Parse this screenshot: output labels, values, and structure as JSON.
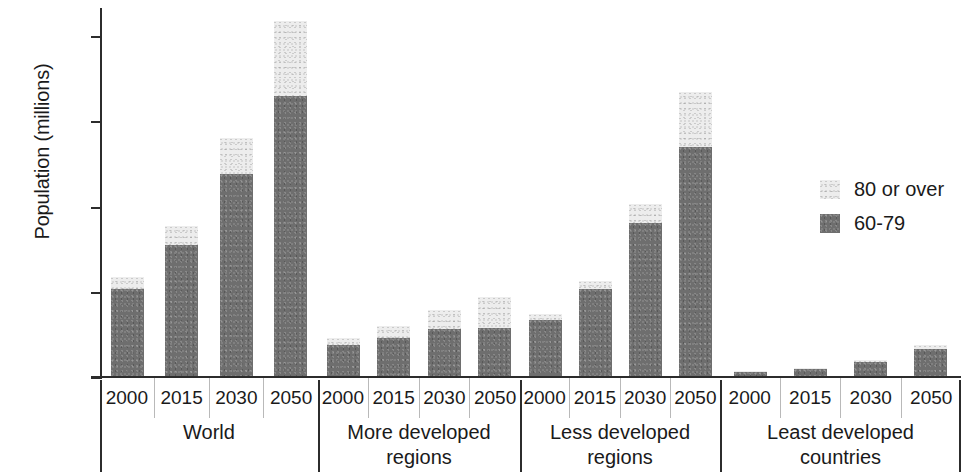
{
  "chart_data": {
    "type": "bar",
    "stacked": true,
    "title": "",
    "xlabel": "",
    "ylabel": "Population (millions)",
    "ylim": [
      0,
      2150
    ],
    "yticks": [
      0,
      500,
      1000,
      1500,
      2000
    ],
    "ytick_labels": [
      "0",
      "500",
      "1.000",
      "1.500",
      "2.000"
    ],
    "grid": false,
    "legend_position": "right",
    "legend": [
      "80 or over",
      "60-79"
    ],
    "colors": {
      "80 or over": "#ededed",
      "60-79": "#6e6e6e"
    },
    "categories": [
      "2000",
      "2015",
      "2030",
      "2050"
    ],
    "groups": [
      "World",
      "More developed regions",
      "Less developed regions",
      "Least developed countries"
    ],
    "series": [
      {
        "name": "60-79",
        "values": {
          "World": [
            510,
            770,
            1185,
            1645
          ],
          "More developed regions": [
            182,
            225,
            278,
            280
          ],
          "Less developed regions": [
            330,
            510,
            900,
            1345
          ],
          "Least developed countries": [
            25,
            42,
            82,
            160
          ]
        }
      },
      {
        "name": "80 or over",
        "values": {
          "World": [
            72,
            110,
            212,
            440
          ],
          "More developed regions": [
            40,
            68,
            108,
            185
          ],
          "Less developed regions": [
            33,
            48,
            110,
            320
          ],
          "Least developed countries": [
            3,
            5,
            10,
            22
          ]
        }
      }
    ],
    "totals": {
      "World": [
        582,
        880,
        1397,
        2085
      ],
      "More developed regions": [
        222,
        293,
        386,
        465
      ],
      "Less developed regions": [
        363,
        558,
        1010,
        1665
      ],
      "Least developed countries": [
        28,
        47,
        92,
        182
      ]
    }
  },
  "axis": {
    "ylabel": "Population (millions)",
    "ytick_labels": [
      "2.000",
      "1.500",
      "1.000",
      "500",
      "0"
    ]
  },
  "legend": {
    "items": [
      {
        "label": "80 or over",
        "color": "#ededed"
      },
      {
        "label": "60-79",
        "color": "#6e6e6e"
      }
    ]
  },
  "groups": [
    {
      "name": "World",
      "name_line1": "World",
      "name_line2": "",
      "years": [
        "2000",
        "2015",
        "2030",
        "2050"
      ]
    },
    {
      "name": "More developed regions",
      "name_line1": "More developed",
      "name_line2": "regions",
      "years": [
        "2000",
        "2015",
        "2030",
        "2050"
      ]
    },
    {
      "name": "Less developed regions",
      "name_line1": "Less developed",
      "name_line2": "regions",
      "years": [
        "2000",
        "2015",
        "2030",
        "2050"
      ]
    },
    {
      "name": "Least developed countries",
      "name_line1": "Least developed",
      "name_line2": "countries",
      "years": [
        "2000",
        "2015",
        "2030",
        "2050"
      ]
    }
  ]
}
